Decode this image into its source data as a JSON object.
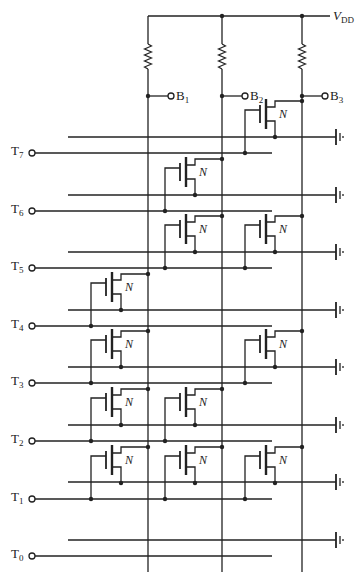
{
  "diagram": {
    "type": "NMOS ROM array",
    "supply": {
      "label": "V",
      "sub": "DD"
    },
    "bit_lines": [
      {
        "label": "B",
        "sub": "1",
        "x": 148
      },
      {
        "label": "B",
        "sub": "2",
        "x": 222
      },
      {
        "label": "B",
        "sub": "3",
        "x": 302
      }
    ],
    "word_lines": [
      {
        "label": "T",
        "sub": "7",
        "y": 153
      },
      {
        "label": "T",
        "sub": "6",
        "y": 211
      },
      {
        "label": "T",
        "sub": "5",
        "y": 268
      },
      {
        "label": "T",
        "sub": "4",
        "y": 326
      },
      {
        "label": "T",
        "sub": "3",
        "y": 383
      },
      {
        "label": "T",
        "sub": "2",
        "y": 441
      },
      {
        "label": "T",
        "sub": "1",
        "y": 499
      },
      {
        "label": "T",
        "sub": "0",
        "y": 556
      }
    ],
    "ground_lines_y": [
      137,
      195,
      252,
      310,
      367,
      425,
      482,
      540
    ],
    "transistor_label": "N",
    "transistors": [
      {
        "word": 7,
        "bit": 3
      },
      {
        "word": 6,
        "bit": 2
      },
      {
        "word": 5,
        "bit": 2
      },
      {
        "word": 5,
        "bit": 3
      },
      {
        "word": 4,
        "bit": 1
      },
      {
        "word": 3,
        "bit": 1
      },
      {
        "word": 3,
        "bit": 3
      },
      {
        "word": 2,
        "bit": 1
      },
      {
        "word": 2,
        "bit": 2
      },
      {
        "word": 1,
        "bit": 1
      },
      {
        "word": 1,
        "bit": 2
      },
      {
        "word": 1,
        "bit": 3
      }
    ]
  }
}
